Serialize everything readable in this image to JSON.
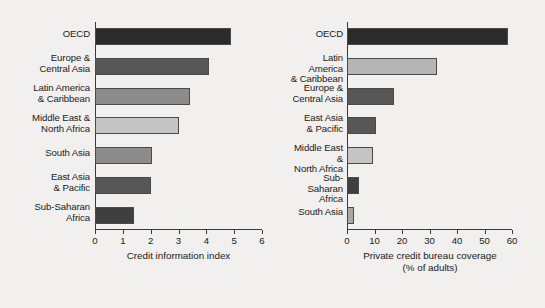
{
  "chart_data": [
    {
      "type": "bar",
      "orientation": "horizontal",
      "panel": "left",
      "title": "",
      "xlabel": "Credit information index",
      "ylabel": "",
      "xlim": [
        0,
        6
      ],
      "xticks": [
        0,
        1,
        2,
        3,
        4,
        5,
        6
      ],
      "xtick_labels": [
        "0",
        "1",
        "2",
        "3",
        "4",
        "5",
        "6"
      ],
      "grid": false,
      "legend": "none",
      "categories": [
        "OECD",
        "Europe &\nCentral Asia",
        "Latin America\n& Caribbean",
        "Middle East &\nNorth Africa",
        "South Asia",
        "East Asia\n& Pacific",
        "Sub-Saharan\nAfrica"
      ],
      "values": [
        4.9,
        4.1,
        3.4,
        3.0,
        2.05,
        2.0,
        1.4
      ],
      "bar_colors": [
        "#2b2b2b",
        "#575757",
        "#8c8c8c",
        "#c4c4c4",
        "#8c8c8c",
        "#575757",
        "#3f3f3f"
      ]
    },
    {
      "type": "bar",
      "orientation": "horizontal",
      "panel": "right",
      "title": "",
      "xlabel": "Private credit bureau coverage\n(% of adults)",
      "ylabel": "",
      "xlim": [
        0,
        60
      ],
      "xticks": [
        0,
        10,
        20,
        30,
        40,
        50,
        60
      ],
      "xtick_labels": [
        "0",
        "10",
        "20",
        "30",
        "40",
        "50",
        "60"
      ],
      "grid": false,
      "legend": "none",
      "categories": [
        "OECD",
        "Latin America\n& Caribbean",
        "Europe &\nCentral Asia",
        "East Asia\n& Pacific",
        "Middle East &\nNorth Africa",
        "Sub-Saharan\nAfrica",
        "South Asia"
      ],
      "values": [
        58.5,
        32.7,
        17.0,
        10.5,
        9.5,
        4.5,
        2.5
      ],
      "bar_colors": [
        "#2b2b2b",
        "#b5b5b5",
        "#575757",
        "#575757",
        "#c4c4c4",
        "#3f3f3f",
        "#a8a8a8"
      ]
    }
  ],
  "left_panel": {
    "axis_title": "Credit information index",
    "tick_labels": [
      "0",
      "1",
      "2",
      "3",
      "4",
      "5",
      "6"
    ],
    "categories": [
      {
        "line1": "OECD",
        "line2": ""
      },
      {
        "line1": "Europe &",
        "line2": "Central Asia"
      },
      {
        "line1": "Latin America",
        "line2": "& Caribbean"
      },
      {
        "line1": "Middle East &",
        "line2": "North Africa"
      },
      {
        "line1": "South Asia",
        "line2": ""
      },
      {
        "line1": "East Asia",
        "line2": "& Pacific"
      },
      {
        "line1": "Sub-Saharan",
        "line2": "Africa"
      }
    ]
  },
  "right_panel": {
    "axis_title_line1": "Private credit bureau coverage",
    "axis_title_line2": "(% of adults)",
    "tick_labels": [
      "0",
      "10",
      "20",
      "30",
      "40",
      "50",
      "60"
    ],
    "categories": [
      {
        "line1": "OECD",
        "line2": ""
      },
      {
        "line1": "Latin America",
        "line2": "& Caribbean"
      },
      {
        "line1": "Europe &",
        "line2": "Central Asia"
      },
      {
        "line1": "East Asia",
        "line2": "& Pacific"
      },
      {
        "line1": "Middle East &",
        "line2": "North Africa"
      },
      {
        "line1": "Sub-Saharan",
        "line2": "Africa"
      },
      {
        "line1": "South Asia",
        "line2": ""
      }
    ]
  }
}
